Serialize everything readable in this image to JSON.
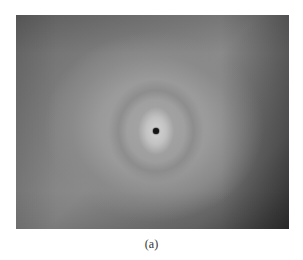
{
  "figure": {
    "caption": "(a)",
    "image": {
      "description": "grayscale photograph of a circular halo pattern with a dark central spot",
      "tone": "grayscale",
      "colors": {
        "center_glow": "#d4d4d4",
        "mid_gray": "#9a9a9a",
        "dark_corner": "#3e3e3e",
        "center_spot": "#151515"
      }
    }
  }
}
